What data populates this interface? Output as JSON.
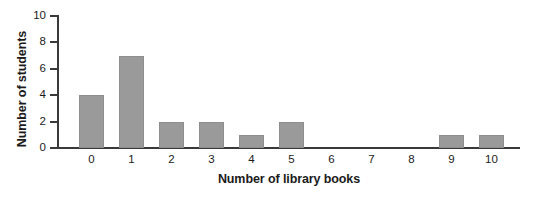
{
  "chart_data": {
    "type": "bar",
    "title": "",
    "subtitle": "",
    "xlabel": "Number of library books",
    "ylabel": "Number of students",
    "categories": [
      "0",
      "1",
      "2",
      "3",
      "4",
      "5",
      "6",
      "7",
      "8",
      "9",
      "10"
    ],
    "values": [
      4,
      7,
      2,
      2,
      1,
      2,
      0,
      0,
      0,
      1,
      1
    ],
    "ylim": [
      0,
      10
    ],
    "yticks": [
      0,
      2,
      4,
      6,
      8,
      10
    ],
    "ytick_labels": [
      "0",
      "2",
      "4",
      "6",
      "8",
      "10"
    ],
    "grid": false,
    "legend": null,
    "annotations": [],
    "colors": {
      "bar_fill": "#9a9a9a",
      "bar_edge": "#8e8e8e",
      "axis": "#3a3a3a",
      "text": "#1b1b1b",
      "background": "#ffffff"
    }
  }
}
